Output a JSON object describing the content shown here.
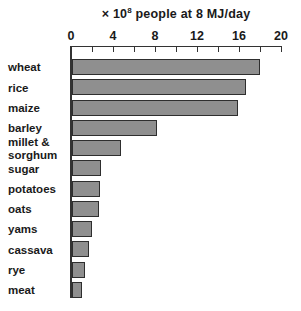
{
  "chart_data": {
    "type": "bar",
    "orientation": "horizontal",
    "title_parts": {
      "prefix": "× 10",
      "exponent": "8",
      "suffix": " people at 8 MJ/day"
    },
    "categories": [
      "wheat",
      "rice",
      "maize",
      "barley",
      "millet &\nsorghum",
      "sugar",
      "potatoes",
      "oats",
      "yams",
      "cassava",
      "rye",
      "meat"
    ],
    "values": [
      17.8,
      16.4,
      15.7,
      7.9,
      4.5,
      2.6,
      2.5,
      2.4,
      1.8,
      1.5,
      1.1,
      0.8
    ],
    "xlabel": "",
    "ylabel": "",
    "xlim": [
      0,
      20
    ],
    "x_tick_labels": [
      0,
      4,
      8,
      12,
      16,
      20
    ],
    "minor_tick_step": 2,
    "grid": false,
    "legend": "none",
    "bar_color": "#8f8f8f",
    "bar_border_color": "#2e2e2e",
    "axis_color": "#333333",
    "background_color": "#ffffff"
  }
}
